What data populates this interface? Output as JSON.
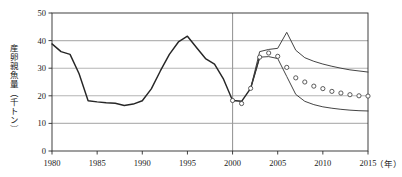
{
  "chart_data": {
    "type": "line",
    "title": "",
    "xlabel": "（年）",
    "ylabel": "産卵親魚量（千トン）",
    "xlim": [
      1980,
      2015
    ],
    "ylim": [
      0,
      50
    ],
    "xticks": [
      1980,
      1985,
      1990,
      1995,
      2000,
      2005,
      2010,
      2015
    ],
    "xtick_labels": [
      "1980",
      "1985",
      "1990",
      "1995",
      "2000",
      "2005",
      "2010",
      "2015"
    ],
    "yticks": [
      0,
      10,
      20,
      30,
      40,
      50
    ],
    "ytick_labels": [
      "0",
      "10",
      "20",
      "30",
      "40",
      "50"
    ],
    "grid": "horizontal-gridlines-at-10-20-30-40",
    "grid_color": "#b5b5b5",
    "legend": "none",
    "reference_line": {
      "x": 2000,
      "color": "#9a9a9a",
      "orientation": "vertical"
    },
    "series": [
      {
        "name": "historical",
        "style": "line",
        "color": "#262626",
        "x": [
          1980,
          1981,
          1982,
          1983,
          1984,
          1985,
          1986,
          1987,
          1988,
          1989,
          1990,
          1991,
          1992,
          1993,
          1994,
          1995,
          1996,
          1997,
          1998,
          1999,
          2000,
          2001,
          2002,
          2003
        ],
        "values": [
          38.8,
          36.0,
          35.0,
          28.0,
          18.2,
          17.8,
          17.5,
          17.3,
          16.5,
          17.0,
          18.2,
          22.5,
          29.0,
          35.0,
          39.5,
          41.6,
          37.5,
          33.5,
          31.5,
          26.0,
          18.3,
          18.0,
          22.7,
          34.0
        ]
      },
      {
        "name": "projection-upper",
        "style": "line",
        "color": "#3a3a3a",
        "x": [
          2002,
          2003,
          2004,
          2005,
          2006,
          2007,
          2008,
          2009,
          2010,
          2011,
          2012,
          2013,
          2014,
          2015
        ],
        "values": [
          22.7,
          36.0,
          36.8,
          37.2,
          43.0,
          36.5,
          33.8,
          32.5,
          31.5,
          30.7,
          30.0,
          29.4,
          29.0,
          28.6
        ]
      },
      {
        "name": "projection-lower",
        "style": "line",
        "color": "#3a3a3a",
        "x": [
          2002,
          2003,
          2004,
          2005,
          2006,
          2007,
          2008,
          2009,
          2010,
          2011,
          2012,
          2013,
          2014,
          2015
        ],
        "values": [
          22.7,
          34.0,
          34.2,
          33.5,
          27.0,
          20.5,
          18.0,
          16.8,
          16.0,
          15.5,
          15.1,
          14.8,
          14.6,
          14.5
        ]
      },
      {
        "name": "projection-median-markers",
        "style": "open-circles",
        "color": "#4a4a4a",
        "x": [
          2000,
          2001,
          2002,
          2003,
          2004,
          2005,
          2006,
          2007,
          2008,
          2009,
          2010,
          2011,
          2012,
          2013,
          2014,
          2015
        ],
        "values": [
          18.3,
          17.2,
          22.7,
          34.0,
          35.5,
          34.3,
          30.3,
          26.5,
          25.0,
          23.5,
          22.6,
          21.6,
          21.0,
          20.4,
          20.0,
          19.9
        ]
      }
    ]
  }
}
